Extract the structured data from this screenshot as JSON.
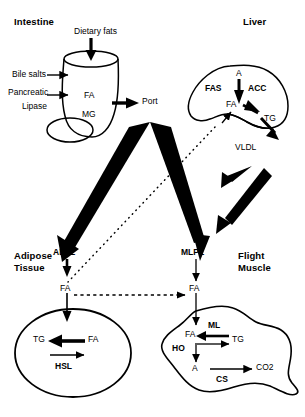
{
  "diagram": {
    "kind": "lipid-metabolism-pathway",
    "organs": {
      "intestine": {
        "title": "Intestine"
      },
      "liver": {
        "title": "Liver"
      },
      "adipose": {
        "title_line1": "Adipose",
        "title_line2": "Tissue"
      },
      "muscle": {
        "title_line1": "Flight",
        "title_line2": "Muscle"
      }
    },
    "intestine": {
      "input_label": "Dietary fats",
      "bile_salts": "Bile salts",
      "pancreatic": "Pancreatic",
      "lipase": "Lipase",
      "fa": "FA",
      "mg": "MG",
      "port": "Port"
    },
    "liver": {
      "a": "A",
      "fas": "FAS",
      "acc": "ACC",
      "fa": "FA",
      "tg": "TG",
      "vldl": "VLDL"
    },
    "adipose": {
      "alpl": "ALPL",
      "fa_outer": "FA",
      "tg": "TG",
      "fa_inner": "FA",
      "hsl": "HSL"
    },
    "muscle": {
      "mlpl": "MLPL",
      "fa_outer": "FA",
      "fa_inner": "FA",
      "ml": "ML",
      "tg": "TG",
      "ho": "HO",
      "a": "A",
      "cs": "CS",
      "co2": "CO2"
    },
    "colors": {
      "ink": "#000000",
      "paper": "#ffffff"
    }
  }
}
